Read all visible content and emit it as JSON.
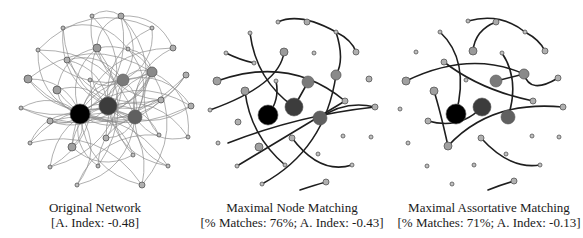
{
  "panels": [
    {
      "id": "original",
      "title": "Original Network",
      "subtitle": "[A. Index: -0.48]",
      "caption_center_x": 95,
      "edge_color": "#8a8a8a",
      "edge_width": 0.8,
      "nodes": [
        [
          80,
          114,
          10,
          "#000000"
        ],
        [
          108,
          106,
          9,
          "#3c3c3c"
        ],
        [
          135,
          117,
          7,
          "#606060"
        ],
        [
          123,
          80,
          6,
          "#7a7a7a"
        ],
        [
          152,
          72,
          5,
          "#8a8a8a"
        ],
        [
          97,
          48,
          4,
          "#9a9a9a"
        ],
        [
          121,
          16,
          3,
          "#aaaaaa"
        ],
        [
          92,
          16,
          2,
          "#bbbbbb"
        ],
        [
          63,
          28,
          2,
          "#bbbbbb"
        ],
        [
          38,
          50,
          2,
          "#c0c0c0"
        ],
        [
          67,
          60,
          3,
          "#b0b0b0"
        ],
        [
          28,
          79,
          4,
          "#a0a0a0"
        ],
        [
          57,
          90,
          4,
          "#a0a0a0"
        ],
        [
          21,
          108,
          2,
          "#c0c0c0"
        ],
        [
          50,
          121,
          3,
          "#b0b0b0"
        ],
        [
          30,
          143,
          2,
          "#c0c0c0"
        ],
        [
          72,
          147,
          4,
          "#a0a0a0"
        ],
        [
          106,
          138,
          3,
          "#b0b0b0"
        ],
        [
          98,
          166,
          2,
          "#bbbbbb"
        ],
        [
          50,
          167,
          2,
          "#c0c0c0"
        ],
        [
          77,
          185,
          2,
          "#c0c0c0"
        ],
        [
          142,
          185,
          3,
          "#b0b0b0"
        ],
        [
          168,
          166,
          2,
          "#c0c0c0"
        ],
        [
          159,
          135,
          2,
          "#c0c0c0"
        ],
        [
          133,
          155,
          2,
          "#c0c0c0"
        ],
        [
          161,
          100,
          3,
          "#b0b0b0"
        ],
        [
          191,
          106,
          3,
          "#b0b0b0"
        ],
        [
          188,
          137,
          2,
          "#c0c0c0"
        ],
        [
          186,
          75,
          3,
          "#b0b0b0"
        ],
        [
          173,
          48,
          3,
          "#b0b0b0"
        ],
        [
          152,
          28,
          2,
          "#c0c0c0"
        ],
        [
          128,
          49,
          2,
          "#c0c0c0"
        ],
        [
          90,
          80,
          2,
          "#c0c0c0"
        ]
      ],
      "edges": [
        [
          0,
          1
        ],
        [
          0,
          2
        ],
        [
          0,
          3
        ],
        [
          0,
          4
        ],
        [
          0,
          5
        ],
        [
          0,
          6
        ],
        [
          0,
          9
        ],
        [
          0,
          11
        ],
        [
          0,
          12
        ],
        [
          0,
          13
        ],
        [
          0,
          14
        ],
        [
          0,
          15
        ],
        [
          0,
          16
        ],
        [
          0,
          18
        ],
        [
          0,
          20
        ],
        [
          0,
          21
        ],
        [
          0,
          24
        ],
        [
          0,
          25
        ],
        [
          0,
          26
        ],
        [
          0,
          28
        ],
        [
          0,
          29
        ],
        [
          1,
          2
        ],
        [
          1,
          3
        ],
        [
          1,
          4
        ],
        [
          1,
          5
        ],
        [
          1,
          7
        ],
        [
          1,
          8
        ],
        [
          1,
          10
        ],
        [
          1,
          11
        ],
        [
          1,
          12
        ],
        [
          1,
          14
        ],
        [
          1,
          16
        ],
        [
          1,
          17
        ],
        [
          1,
          19
        ],
        [
          1,
          21
        ],
        [
          1,
          22
        ],
        [
          1,
          23
        ],
        [
          1,
          26
        ],
        [
          1,
          27
        ],
        [
          1,
          28
        ],
        [
          1,
          30
        ],
        [
          2,
          3
        ],
        [
          2,
          4
        ],
        [
          2,
          6
        ],
        [
          2,
          8
        ],
        [
          2,
          9
        ],
        [
          2,
          12
        ],
        [
          2,
          15
        ],
        [
          2,
          17
        ],
        [
          2,
          18
        ],
        [
          2,
          20
        ],
        [
          2,
          22
        ],
        [
          2,
          25
        ],
        [
          2,
          27
        ],
        [
          2,
          29
        ],
        [
          2,
          31
        ],
        [
          3,
          4
        ],
        [
          3,
          6
        ],
        [
          3,
          7
        ],
        [
          3,
          10
        ],
        [
          3,
          13
        ],
        [
          3,
          16
        ],
        [
          3,
          19
        ],
        [
          3,
          24
        ],
        [
          3,
          26
        ],
        [
          3,
          30
        ],
        [
          3,
          32
        ],
        [
          4,
          5
        ],
        [
          4,
          9
        ],
        [
          4,
          11
        ],
        [
          4,
          14
        ],
        [
          4,
          17
        ],
        [
          4,
          21
        ],
        [
          4,
          23
        ],
        [
          4,
          27
        ],
        [
          4,
          31
        ],
        [
          5,
          6
        ],
        [
          5,
          12
        ],
        [
          5,
          18
        ],
        [
          5,
          25
        ],
        [
          6,
          29
        ],
        [
          6,
          7
        ],
        [
          9,
          30
        ],
        [
          11,
          26
        ],
        [
          14,
          22
        ],
        [
          16,
          24
        ],
        [
          20,
          23
        ],
        [
          13,
          28
        ],
        [
          15,
          21
        ],
        [
          19,
          32
        ],
        [
          8,
          31
        ],
        [
          10,
          25
        ]
      ]
    },
    {
      "id": "node-matching",
      "title": "Maximal Node Matching",
      "subtitle": "[% Matches: 76%; A. Index: -0.43]",
      "caption_center_x": 292,
      "edge_color": "#1e1e1e",
      "edge_width": 1.6,
      "nodes": [
        [
          268,
          115,
          10,
          "#000000"
        ],
        [
          294,
          107,
          9,
          "#3c3c3c"
        ],
        [
          320,
          118,
          7,
          "#606060"
        ],
        [
          308,
          82,
          6,
          "#7a7a7a"
        ],
        [
          336,
          75,
          5,
          "#8a8a8a"
        ],
        [
          284,
          52,
          4,
          "#9a9a9a"
        ],
        [
          307,
          22,
          3,
          "#aaaaaa"
        ],
        [
          278,
          22,
          2,
          "#bbbbbb"
        ],
        [
          250,
          33,
          2,
          "#bbbbbb"
        ],
        [
          226,
          53,
          2,
          "#c0c0c0"
        ],
        [
          254,
          63,
          2,
          "#c0c0c0"
        ],
        [
          217,
          81,
          4,
          "#a0a0a0"
        ],
        [
          245,
          91,
          4,
          "#a0a0a0"
        ],
        [
          210,
          110,
          2,
          "#c0c0c0"
        ],
        [
          238,
          122,
          3,
          "#b0b0b0"
        ],
        [
          218,
          143,
          2,
          "#c0c0c0"
        ],
        [
          259,
          147,
          4,
          "#a0a0a0"
        ],
        [
          292,
          138,
          3,
          "#b0b0b0"
        ],
        [
          285,
          165,
          2,
          "#bbbbbb"
        ],
        [
          237,
          166,
          2,
          "#c0c0c0"
        ],
        [
          262,
          184,
          2,
          "#c0c0c0"
        ],
        [
          326,
          182,
          3,
          "#b0b0b0"
        ],
        [
          352,
          165,
          2,
          "#c0c0c0"
        ],
        [
          343,
          136,
          2,
          "#c0c0c0"
        ],
        [
          318,
          154,
          2,
          "#c0c0c0"
        ],
        [
          345,
          101,
          3,
          "#b0b0b0"
        ],
        [
          375,
          107,
          3,
          "#b0b0b0"
        ],
        [
          371,
          137,
          2,
          "#c0c0c0"
        ],
        [
          369,
          79,
          3,
          "#b0b0b0"
        ],
        [
          356,
          52,
          3,
          "#b0b0b0"
        ],
        [
          336,
          32,
          2,
          "#c0c0c0"
        ],
        [
          314,
          53,
          2,
          "#c0c0c0"
        ],
        [
          276,
          81,
          2,
          "#c0c0c0"
        ]
      ],
      "curves": [
        [
          "M278,22 Q300,12 336,32 Q352,40 356,52"
        ],
        [
          "M250,33 Q256,80 294,107"
        ],
        [
          "M226,53 Q240,60 254,63"
        ],
        [
          "M284,52 Q280,85 210,110"
        ],
        [
          "M217,81 Q290,55 345,101"
        ],
        [
          "M276,81 Q280,100 268,115"
        ],
        [
          "M294,107 L308,82"
        ],
        [
          "M228,143 Q300,115 375,107 Q345,100 320,118"
        ],
        [
          "M336,32 Q345,60 336,75 Q325,150 262,184"
        ],
        [
          "M245,91 Q250,135 285,165"
        ],
        [
          "M292,138 Q320,175 352,165"
        ],
        [
          "M237,166 Q280,140 345,101"
        ],
        [
          "M300,190 Q315,185 326,182"
        ]
      ]
    },
    {
      "id": "assortative-matching",
      "title": "Maximal Assortative Matching",
      "subtitle": "[% Matches: 71%; A. Index: -0.13]",
      "caption_center_x": 489,
      "edge_color": "#1e1e1e",
      "edge_width": 1.6,
      "nodes": [
        [
          456,
          114,
          10,
          "#000000"
        ],
        [
          482,
          107,
          9,
          "#3c3c3c"
        ],
        [
          508,
          117,
          7,
          "#606060"
        ],
        [
          496,
          81,
          6,
          "#7a7a7a"
        ],
        [
          524,
          74,
          5,
          "#8a8a8a"
        ],
        [
          473,
          51,
          4,
          "#9a9a9a"
        ],
        [
          496,
          22,
          3,
          "#aaaaaa"
        ],
        [
          468,
          21,
          2,
          "#bbbbbb"
        ],
        [
          440,
          32,
          2,
          "#bbbbbb"
        ],
        [
          416,
          52,
          2,
          "#c0c0c0"
        ],
        [
          444,
          62,
          3,
          "#b0b0b0"
        ],
        [
          406,
          81,
          4,
          "#a0a0a0"
        ],
        [
          434,
          91,
          4,
          "#a0a0a0"
        ],
        [
          400,
          109,
          2,
          "#c0c0c0"
        ],
        [
          428,
          121,
          3,
          "#b0b0b0"
        ],
        [
          408,
          143,
          2,
          "#c0c0c0"
        ],
        [
          448,
          146,
          4,
          "#a0a0a0"
        ],
        [
          481,
          138,
          3,
          "#b0b0b0"
        ],
        [
          474,
          165,
          2,
          "#bbbbbb"
        ],
        [
          427,
          166,
          2,
          "#c0c0c0"
        ],
        [
          452,
          184,
          2,
          "#c0c0c0"
        ],
        [
          514,
          181,
          3,
          "#b0b0b0"
        ],
        [
          540,
          165,
          2,
          "#c0c0c0"
        ],
        [
          532,
          136,
          2,
          "#c0c0c0"
        ],
        [
          506,
          154,
          2,
          "#c0c0c0"
        ],
        [
          533,
          101,
          3,
          "#b0b0b0"
        ],
        [
          563,
          107,
          3,
          "#b0b0b0"
        ],
        [
          559,
          137,
          2,
          "#c0c0c0"
        ],
        [
          558,
          78,
          3,
          "#b0b0b0"
        ],
        [
          545,
          51,
          3,
          "#b0b0b0"
        ],
        [
          525,
          32,
          2,
          "#c0c0c0"
        ],
        [
          502,
          53,
          2,
          "#c0c0c0"
        ],
        [
          466,
          80,
          2,
          "#c0c0c0"
        ]
      ],
      "curves": [
        [
          "M468,21 Q500,12 525,32 Q540,40 545,51"
        ],
        [
          "M496,22 Q475,30 473,51"
        ],
        [
          "M440,32 Q470,60 456,114"
        ],
        [
          "M444,62 Q480,90 533,101"
        ],
        [
          "M406,81 Q470,50 524,74 Q530,95 558,78"
        ],
        [
          "M496,81 L524,74"
        ],
        [
          "M502,53 Q520,80 508,117"
        ],
        [
          "M428,121 Q460,130 482,107"
        ],
        [
          "M448,146 Q440,110 434,91"
        ],
        [
          "M448,146 Q490,100 563,107"
        ],
        [
          "M481,138 Q510,170 540,165"
        ],
        [
          "M488,190 Q500,185 514,181"
        ]
      ]
    }
  ]
}
